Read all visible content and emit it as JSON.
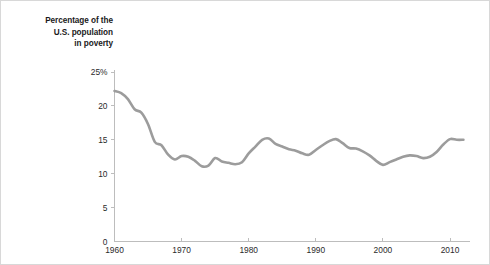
{
  "figure": {
    "background_color": "#ffffff",
    "border_color": "#d8d8d8",
    "title": "Percentage of the\nU.S. population\nin poverty"
  },
  "chart_data": {
    "type": "line",
    "title": "Percentage of the U.S. population in poverty",
    "subtitle": "",
    "xlabel": "",
    "ylabel": "Percentage of the U.S. population in poverty",
    "xlim": [
      1960,
      2013
    ],
    "ylim": [
      0,
      25
    ],
    "grid": false,
    "legend_position": "none",
    "line_color": "#9c9c9c",
    "line_width": 2.6,
    "y_ticks": [
      0,
      5,
      10,
      15,
      20,
      25
    ],
    "y_tick_labels": [
      "0",
      "5",
      "10",
      "15",
      "20",
      "25%"
    ],
    "x_ticks": [
      1960,
      1970,
      1980,
      1990,
      2000,
      2010
    ],
    "x_tick_labels": [
      "1960",
      "1970",
      "1980",
      "1990",
      "2000",
      "2010"
    ],
    "series": [
      {
        "name": "Percentage of the U.S. population in poverty",
        "x": [
          1960,
          1961,
          1962,
          1963,
          1964,
          1965,
          1966,
          1967,
          1968,
          1969,
          1970,
          1971,
          1972,
          1973,
          1974,
          1975,
          1976,
          1977,
          1978,
          1979,
          1980,
          1981,
          1982,
          1983,
          1984,
          1985,
          1986,
          1987,
          1988,
          1989,
          1990,
          1991,
          1992,
          1993,
          1994,
          1995,
          1996,
          1997,
          1998,
          1999,
          2000,
          2001,
          2002,
          2003,
          2004,
          2005,
          2006,
          2007,
          2008,
          2009,
          2010,
          2011,
          2012
        ],
        "values": [
          22.2,
          21.9,
          21.0,
          19.5,
          19.0,
          17.3,
          14.7,
          14.2,
          12.8,
          12.1,
          12.6,
          12.5,
          11.9,
          11.1,
          11.2,
          12.3,
          11.8,
          11.6,
          11.4,
          11.7,
          13.0,
          14.0,
          15.0,
          15.2,
          14.4,
          14.0,
          13.6,
          13.4,
          13.0,
          12.8,
          13.5,
          14.2,
          14.8,
          15.1,
          14.5,
          13.8,
          13.7,
          13.3,
          12.7,
          11.9,
          11.3,
          11.7,
          12.1,
          12.5,
          12.7,
          12.6,
          12.3,
          12.5,
          13.2,
          14.3,
          15.1,
          15.0,
          15.0
        ]
      }
    ]
  }
}
